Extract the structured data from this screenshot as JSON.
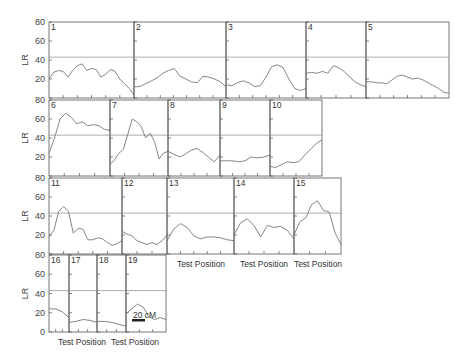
{
  "chart_data": {
    "type": "line",
    "title": "",
    "ylabel": "LR",
    "xlabel": "Test Position",
    "ylim": [
      0,
      80
    ],
    "yticks": [
      0,
      20,
      40,
      60,
      80
    ],
    "threshold": 43,
    "scale_bar": "20 cM",
    "rows": [
      {
        "top": 22,
        "bottom": 98,
        "show_y_labels": true,
        "panels": [
          {
            "chromosome": "1",
            "x0": 49,
            "x1": 134,
            "values": [
              20,
              27,
              29,
              28,
              22,
              29,
              34,
              36,
              29,
              31,
              30,
              22,
              25,
              30,
              28,
              20,
              15,
              10,
              3
            ]
          },
          {
            "chromosome": "2",
            "x0": 134,
            "x1": 226,
            "values": [
              12,
              12,
              15,
              18,
              21,
              26,
              29,
              31,
              23,
              20,
              17,
              16,
              23,
              22,
              20,
              17,
              12
            ]
          },
          {
            "chromosome": "3",
            "x0": 226,
            "x1": 306,
            "values": [
              14,
              13,
              16,
              18,
              16,
              12,
              13,
              22,
              33,
              35,
              32,
              20,
              10,
              8,
              10
            ]
          },
          {
            "chromosome": "4",
            "x0": 306,
            "x1": 366,
            "values": [
              26,
              27,
              26,
              28,
              26,
              34,
              32,
              28,
              22,
              17,
              14,
              12
            ]
          },
          {
            "chromosome": "5",
            "x0": 366,
            "x1": 449,
            "values": [
              17,
              17,
              16,
              16,
              15,
              19,
              23,
              24,
              22,
              20,
              21,
              19,
              16,
              13,
              10,
              6,
              5
            ]
          }
        ]
      },
      {
        "top": 100,
        "bottom": 176,
        "show_y_labels": true,
        "panels": [
          {
            "chromosome": "6",
            "x0": 49,
            "x1": 110,
            "values": [
              24,
              40,
              60,
              66,
              62,
              55,
              57,
              53,
              54,
              53,
              49,
              48
            ]
          },
          {
            "chromosome": "7",
            "x0": 110,
            "x1": 168,
            "values": [
              12,
              17,
              24,
              28,
              44,
              60,
              57,
              52,
              40,
              45,
              36,
              18,
              24,
              26
            ]
          },
          {
            "chromosome": "8",
            "x0": 168,
            "x1": 220,
            "values": [
              26,
              23,
              20,
              23,
              27,
              29,
              25,
              20,
              15,
              22
            ]
          },
          {
            "chromosome": "9",
            "x0": 220,
            "x1": 270,
            "values": [
              16,
              16,
              16,
              15,
              16,
              20,
              19,
              20,
              22
            ]
          },
          {
            "chromosome": "10",
            "x0": 270,
            "x1": 322,
            "values": [
              10,
              9,
              12,
              15,
              14,
              15,
              22,
              28,
              34,
              38
            ]
          }
        ]
      },
      {
        "top": 178,
        "bottom": 254,
        "show_y_labels": true,
        "panels": [
          {
            "chromosome": "11",
            "x0": 49,
            "x1": 122,
            "values": [
              18,
              25,
              45,
              50,
              45,
              22,
              27,
              26,
              15,
              15,
              17,
              16,
              12,
              9,
              11,
              14
            ]
          },
          {
            "chromosome": "12",
            "x0": 122,
            "x1": 167,
            "values": [
              24,
              21,
              19,
              14,
              12,
              10,
              12,
              10,
              14,
              20
            ]
          },
          {
            "chromosome": "13",
            "x0": 167,
            "x1": 234,
            "values": [
              14,
              26,
              32,
              28,
              19,
              16,
              18,
              18,
              17,
              15,
              14
            ]
          },
          {
            "chromosome": "14",
            "x0": 234,
            "x1": 294,
            "values": [
              20,
              33,
              37,
              30,
              18,
              30,
              28,
              29,
              25,
              16
            ]
          },
          {
            "chromosome": "15",
            "x0": 294,
            "x1": 341,
            "values": [
              20,
              34,
              38,
              52,
              56,
              46,
              44,
              22,
              10
            ]
          }
        ]
      },
      {
        "top": 255,
        "bottom": 332,
        "show_y_labels": true,
        "panels": [
          {
            "chromosome": "16",
            "x0": 49,
            "x1": 69,
            "values": [
              24,
              24,
              21,
              15
            ]
          },
          {
            "chromosome": "17",
            "x0": 69,
            "x1": 97,
            "values": [
              10,
              11,
              13,
              12,
              10
            ]
          },
          {
            "chromosome": "18",
            "x0": 97,
            "x1": 126,
            "values": [
              11,
              11,
              10,
              8,
              6
            ]
          },
          {
            "chromosome": "19",
            "x0": 126,
            "x1": 166,
            "values": [
              19,
              24,
              29,
              26,
              16,
              13,
              15,
              13
            ]
          }
        ]
      }
    ],
    "x_labels": [
      {
        "text": "Test Position",
        "x": 201,
        "y": 267
      },
      {
        "text": "Test Position",
        "x": 264,
        "y": 267
      },
      {
        "text": "Test Position",
        "x": 318,
        "y": 267
      },
      {
        "text": "Test Position",
        "x": 82,
        "y": 345
      },
      {
        "text": "Test Position",
        "x": 135,
        "y": 345
      }
    ]
  }
}
